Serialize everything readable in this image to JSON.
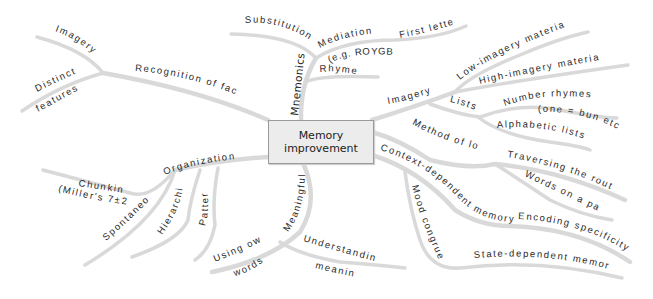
{
  "center": {
    "line1": "Memory",
    "line2": "improvement"
  },
  "branches": {
    "recognition_of_faces": {
      "label": "Recognition of faces",
      "children": {
        "imagery": "Imagery",
        "distinct_1": "Distinct",
        "distinct_2": "features"
      }
    },
    "mnemonics": {
      "label": "Mnemonics",
      "children": {
        "substitution": "Substitution",
        "mediation": "Mediation",
        "mediation_example": "(e.g. ROYGBIV)",
        "first_letter": "First letter",
        "rhymes": "Rhymes"
      }
    },
    "imagery": {
      "label": "Imagery",
      "children": {
        "low_imagery": "Low-imagery material",
        "high_imagery": "High-imagery material",
        "lists": "Lists",
        "number_rhymes": "Number rhymes",
        "number_rhymes_example": "(one = bun etc.)",
        "alphabetic_lists": "Alphabetic lists"
      }
    },
    "method_of_loci": {
      "label": "Method of loci",
      "children": {
        "traversing": "Traversing the route",
        "words_on_page": "Words on a page"
      }
    },
    "context_dependent": {
      "label": "Context-dependent memory",
      "children": {
        "encoding_specificity": "Encoding specificity",
        "mood_congruence": "Mood congruence",
        "state_dependent": "State-dependent memory"
      }
    },
    "organization": {
      "label": "Organization",
      "children": {
        "chunking": "Chunking",
        "chunking_example": "(Miller's 7±2)",
        "spontaneous": "Spontaneous",
        "hierarchies": "Hierarchies",
        "patterns": "Patterns"
      }
    },
    "meaningfulness": {
      "label": "Meaningfulness",
      "children": {
        "using_own_1": "Using own",
        "using_own_2": "words",
        "understanding_1": "Understanding",
        "understanding_2": "meaning"
      }
    }
  },
  "colors": {
    "branch": "#d9d9d9",
    "text": "#2b2b2b",
    "box_fill": "#ececec",
    "box_border": "#9a9a9a"
  }
}
